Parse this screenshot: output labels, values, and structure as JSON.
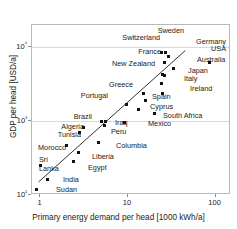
{
  "chart_data": {
    "type": "scatter",
    "title": "",
    "xlabel": "Primary energy demand per head [1000 kWh/a]",
    "ylabel": "GDP per head [USD/a]",
    "xscale": "log",
    "yscale": "log",
    "xlim": [
      0.8,
      150
    ],
    "ylim": [
      100,
      20000
    ],
    "xticks": [
      "1",
      "10",
      "100"
    ],
    "xtick_values": [
      1,
      10,
      100
    ],
    "yticks": [
      "10⁴",
      "10³",
      "10²"
    ],
    "ytick_values": [
      10000,
      1000,
      100
    ],
    "grid": true,
    "legend": "none",
    "annotations": [
      "trend line through data (log-log linear fit)"
    ],
    "points": [
      {
        "label": "Sweden",
        "x": 27,
        "y": 8600,
        "lx": 184,
        "ly": 31,
        "align": "r"
      },
      {
        "label": "Germany",
        "x": 29,
        "y": 7500,
        "lx": 196,
        "ly": 42,
        "align": "l"
      },
      {
        "label": "USA",
        "x": 85,
        "y": 6300,
        "lx": 211,
        "ly": 49,
        "align": "l"
      },
      {
        "label": "Switzerland",
        "x": 24,
        "y": 8600,
        "lx": 160,
        "ly": 38,
        "align": "r"
      },
      {
        "label": "France",
        "x": 26,
        "y": 6300,
        "lx": 161,
        "ly": 52,
        "align": "r"
      },
      {
        "label": "Australia",
        "x": 33,
        "y": 5200,
        "lx": 197,
        "ly": 60,
        "align": "l"
      },
      {
        "label": "New Zealand",
        "x": 25,
        "y": 4300,
        "lx": 155,
        "ly": 64,
        "align": "r"
      },
      {
        "label": "Japan",
        "x": 26,
        "y": 4200,
        "lx": 188,
        "ly": 71,
        "align": "l"
      },
      {
        "label": "Italy",
        "x": 24,
        "y": 3200,
        "lx": 184,
        "ly": 79,
        "align": "l"
      },
      {
        "label": "Ireland",
        "x": 25,
        "y": 2400,
        "lx": 190,
        "ly": 89,
        "align": "l"
      },
      {
        "label": "Greece",
        "x": 15,
        "y": 2400,
        "lx": 133,
        "ly": 85,
        "align": "r"
      },
      {
        "label": "Spain",
        "x": 16,
        "y": 1900,
        "lx": 152,
        "ly": 97,
        "align": "l"
      },
      {
        "label": "Portugal",
        "x": 9.5,
        "y": 1700,
        "lx": 108,
        "ly": 96,
        "align": "r"
      },
      {
        "label": "Cyprus",
        "x": 13,
        "y": 1450,
        "lx": 150,
        "ly": 107,
        "align": "l"
      },
      {
        "label": "South Africa",
        "x": 20,
        "y": 1250,
        "lx": 163,
        "ly": 116,
        "align": "l"
      },
      {
        "label": "Brazil",
        "x": 5.0,
        "y": 1000,
        "lx": 92,
        "ly": 117,
        "align": "r"
      },
      {
        "label": "Iraq",
        "x": 5.6,
        "y": 1000,
        "lx": 115,
        "ly": 123,
        "align": "l"
      },
      {
        "label": "Mexico",
        "x": 9.0,
        "y": 960,
        "lx": 148,
        "ly": 124,
        "align": "l"
      },
      {
        "label": "Peru",
        "x": 5.4,
        "y": 870,
        "lx": 111,
        "ly": 132,
        "align": "l"
      },
      {
        "label": "Algeria",
        "x": 3.1,
        "y": 830,
        "lx": 84,
        "ly": 127,
        "align": "r"
      },
      {
        "label": "Tunisia",
        "x": 2.8,
        "y": 700,
        "lx": 81,
        "ly": 135,
        "align": "r"
      },
      {
        "label": "Columbia",
        "x": 4.6,
        "y": 520,
        "lx": 116,
        "ly": 146,
        "align": "l"
      },
      {
        "label": "Morocco",
        "x": 2.0,
        "y": 470,
        "lx": 66,
        "ly": 148,
        "align": "r"
      },
      {
        "label": "Liberia",
        "x": 2.7,
        "y": 380,
        "lx": 92,
        "ly": 157,
        "align": "l"
      },
      {
        "label": "Egypt",
        "x": 2.4,
        "y": 280,
        "lx": 88,
        "ly": 168,
        "align": "l"
      },
      {
        "label": "Sri\nLanka",
        "x": 1.0,
        "y": 250,
        "lx": 39,
        "ly": 164,
        "align": "l"
      },
      {
        "label": "India",
        "x": 1.2,
        "y": 160,
        "lx": 63,
        "ly": 180,
        "align": "l"
      },
      {
        "label": "Sudan",
        "x": 0.9,
        "y": 120,
        "lx": 56,
        "ly": 190,
        "align": "l"
      }
    ],
    "trendline": {
      "x1": 0.95,
      "y1": 150,
      "x2": 45,
      "y2": 9000
    }
  }
}
